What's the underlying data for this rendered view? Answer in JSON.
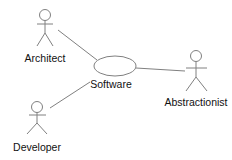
{
  "diagram": {
    "type": "use-case",
    "line_color": "#808080",
    "actors": [
      {
        "id": "architect",
        "label": "Architect",
        "x": 45,
        "y": 15,
        "label_y": 52
      },
      {
        "id": "abstractionist",
        "label": "Abstractionist",
        "x": 196,
        "y": 56,
        "label_y": 96
      },
      {
        "id": "developer",
        "label": "Developer",
        "x": 37,
        "y": 107,
        "label_y": 141
      }
    ],
    "use_cases": [
      {
        "id": "software",
        "label": "Software",
        "cx": 115,
        "cy": 66,
        "rx": 21,
        "ry": 10,
        "label_x": 111,
        "label_y": 78
      }
    ],
    "associations": [
      {
        "from": "architect",
        "to": "software"
      },
      {
        "from": "abstractionist",
        "to": "software"
      },
      {
        "from": "developer",
        "to": "software"
      }
    ]
  }
}
